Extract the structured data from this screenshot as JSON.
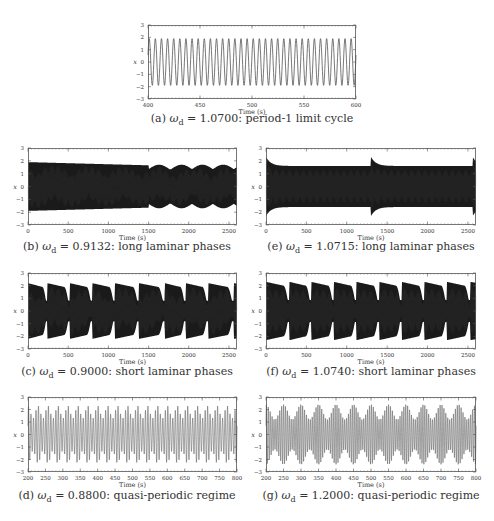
{
  "figure": {
    "panels": [
      {
        "id": "a",
        "letter": "(a)",
        "omega_symbol": "ω",
        "omega_sub": "d",
        "omega_value": "= 1.0700:",
        "description": "period-1 limit cycle",
        "frame": {
          "x": 148,
          "y": 25,
          "w": 208,
          "h": 74
        },
        "caption_pos": {
          "cx": 252,
          "y": 119
        }
      },
      {
        "id": "b",
        "letter": "(b)",
        "omega_symbol": "ω",
        "omega_sub": "d",
        "omega_value": "= 0.9132:",
        "description": "long laminar phases",
        "frame": {
          "x": 28,
          "y": 148,
          "w": 209,
          "h": 77
        },
        "caption_pos": {
          "cx": 127,
          "y": 247
        }
      },
      {
        "id": "e",
        "letter": "(e)",
        "omega_symbol": "ω",
        "omega_sub": "d",
        "omega_value": "= 1.0715:",
        "description": "long laminar phases",
        "frame": {
          "x": 266,
          "y": 148,
          "w": 210,
          "h": 77
        },
        "caption_pos": {
          "cx": 371,
          "y": 247
        }
      },
      {
        "id": "c",
        "letter": "(c)",
        "omega_symbol": "ω",
        "omega_sub": "d",
        "omega_value": "= 0.9000:",
        "description": "short laminar phases",
        "frame": {
          "x": 28,
          "y": 273,
          "w": 209,
          "h": 76
        },
        "caption_pos": {
          "cx": 127,
          "y": 372
        }
      },
      {
        "id": "f",
        "letter": "(f)",
        "omega_symbol": "ω",
        "omega_sub": "d",
        "omega_value": "= 1.0740:",
        "description": "short laminar phases",
        "frame": {
          "x": 266,
          "y": 273,
          "w": 210,
          "h": 76
        },
        "caption_pos": {
          "cx": 371,
          "y": 372
        }
      },
      {
        "id": "d",
        "letter": "(d)",
        "omega_symbol": "ω",
        "omega_sub": "d",
        "omega_value": "= 0.8800:",
        "description": "quasi-periodic regime",
        "frame": {
          "x": 28,
          "y": 397,
          "w": 209,
          "h": 75
        },
        "caption_pos": {
          "cx": 127,
          "y": 496
        }
      },
      {
        "id": "g",
        "letter": "(g)",
        "omega_symbol": "ω",
        "omega_sub": "d",
        "omega_value": "= 1.2000:",
        "description": "quasi-periodic regime",
        "frame": {
          "x": 266,
          "y": 397,
          "w": 210,
          "h": 75
        },
        "caption_pos": {
          "cx": 371,
          "y": 496
        }
      }
    ]
  },
  "chart_data": [
    {
      "panel": "a",
      "type": "line",
      "title": "(a) ωd = 1.0700: period-1 limit cycle",
      "xlabel": "Time (s)",
      "ylabel": "x",
      "xlim": [
        400,
        600
      ],
      "ylim": [
        -3,
        3
      ],
      "xticks": [
        400,
        450,
        500,
        550,
        600
      ],
      "yticks": [
        -3,
        -2,
        -1,
        0,
        1,
        2,
        3
      ],
      "signal": {
        "kind": "sine",
        "amplitude": 1.9,
        "cycles": 34
      },
      "color": "#555555"
    },
    {
      "panel": "b",
      "type": "line",
      "title": "(b) ωd = 0.9132: long laminar phases",
      "xlabel": "Time (s)",
      "ylabel": "x",
      "xlim": [
        0,
        2600
      ],
      "ylim": [
        -3,
        3
      ],
      "xticks": [
        0,
        500,
        1000,
        1500,
        2000,
        2500
      ],
      "yticks": [
        -3,
        -2,
        -1,
        0,
        1,
        2,
        3
      ],
      "signal": {
        "kind": "dense_envelope",
        "laminar_until": 1500,
        "laminar_amp": 1.9,
        "bursts": [
          1500,
          1780,
          2040,
          2300,
          2560
        ],
        "burst_amp": [
          1.6,
          1.8
        ]
      },
      "color": "#1a1a1a"
    },
    {
      "panel": "e",
      "type": "line",
      "title": "(e) ωd = 1.0715: long laminar phases",
      "xlabel": "Time (s)",
      "ylabel": "x",
      "xlim": [
        0,
        2600
      ],
      "ylim": [
        -3,
        3
      ],
      "xticks": [
        0,
        500,
        1000,
        1500,
        2000,
        2500
      ],
      "yticks": [
        -3,
        -2,
        -1,
        0,
        1,
        2,
        3
      ],
      "signal": {
        "kind": "dense_decay",
        "resets": [
          0,
          1300,
          2560
        ],
        "peak_amp": 2.3,
        "settle_amp": 1.6
      },
      "color": "#1a1a1a"
    },
    {
      "panel": "c",
      "type": "line",
      "title": "(c) ωd = 0.9000: short laminar phases",
      "xlabel": "Time (s)",
      "ylabel": "x",
      "xlim": [
        0,
        2600
      ],
      "ylim": [
        -3,
        3
      ],
      "xticks": [
        0,
        500,
        1000,
        1500,
        2000,
        2500
      ],
      "yticks": [
        -3,
        -2,
        -1,
        0,
        1,
        2,
        3
      ],
      "signal": {
        "kind": "dense_bursts",
        "burst_starts": [
          0,
          240,
          520,
          800,
          1080,
          1380,
          1700,
          1960,
          2240,
          2560
        ],
        "peak_amp": 2.2
      },
      "color": "#1a1a1a"
    },
    {
      "panel": "f",
      "type": "line",
      "title": "(f) ωd = 1.0740: short laminar phases",
      "xlabel": "Time (s)",
      "ylabel": "x",
      "xlim": [
        0,
        2600
      ],
      "ylim": [
        -3,
        3
      ],
      "xticks": [
        0,
        500,
        1000,
        1500,
        2000,
        2500
      ],
      "yticks": [
        -3,
        -2,
        -1,
        0,
        1,
        2,
        3
      ],
      "signal": {
        "kind": "dense_bursts",
        "burst_starts": [
          0,
          290,
          560,
          840,
          1120,
          1400,
          1680,
          1960,
          2240,
          2530
        ],
        "peak_amp": 2.3
      },
      "color": "#1a1a1a"
    },
    {
      "panel": "d",
      "type": "line",
      "title": "(d) ωd = 0.8800: quasi-periodic regime",
      "xlabel": "Time (s)",
      "ylabel": "x",
      "xlim": [
        200,
        800
      ],
      "ylim": [
        -3,
        3
      ],
      "xticks": [
        200,
        250,
        300,
        350,
        400,
        450,
        500,
        550,
        600,
        650,
        700,
        750,
        800
      ],
      "yticks": [
        -3,
        -2,
        -1,
        0,
        1,
        2,
        3
      ],
      "signal": {
        "kind": "beat",
        "carrier_cycles": 84,
        "beat_cycles": 21,
        "amp_max": 2.3,
        "amp_min": 1.3
      },
      "color": "#666666"
    },
    {
      "panel": "g",
      "type": "line",
      "title": "(g) ωd = 1.2000: quasi-periodic regime",
      "xlabel": "Time (s)",
      "ylabel": "x",
      "xlim": [
        200,
        800
      ],
      "ylim": [
        -3,
        3
      ],
      "xticks": [
        200,
        250,
        300,
        350,
        400,
        450,
        500,
        550,
        600,
        650,
        700,
        750,
        800
      ],
      "yticks": [
        -3,
        -2,
        -1,
        0,
        1,
        2,
        3
      ],
      "signal": {
        "kind": "beat",
        "carrier_cycles": 110,
        "beat_cycles": 12,
        "amp_max": 2.4,
        "amp_min": 1.2
      },
      "color": "#666666"
    }
  ]
}
